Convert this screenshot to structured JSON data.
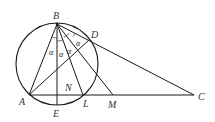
{
  "diagram": {
    "points": {
      "B": {
        "label": "B",
        "x": 57,
        "y": 24
      },
      "D": {
        "label": "D",
        "x": 89,
        "y": 40
      },
      "A": {
        "label": "A",
        "x": 29,
        "y": 95
      },
      "E": {
        "label": "E",
        "x": 57,
        "y": 105
      },
      "N": {
        "label": "N",
        "x": 57,
        "y": 95
      },
      "L": {
        "label": "L",
        "x": 83,
        "y": 95
      },
      "M": {
        "label": "M",
        "x": 113,
        "y": 95
      },
      "C": {
        "label": "C",
        "x": 194,
        "y": 95
      }
    },
    "circle": {
      "cx": 57,
      "cy": 64,
      "r": 41
    },
    "angle_labels": [
      "α",
      "α",
      "α",
      "α"
    ],
    "segments": [
      "BA",
      "BE",
      "BL",
      "BM",
      "BC",
      "AD",
      "AC"
    ]
  }
}
